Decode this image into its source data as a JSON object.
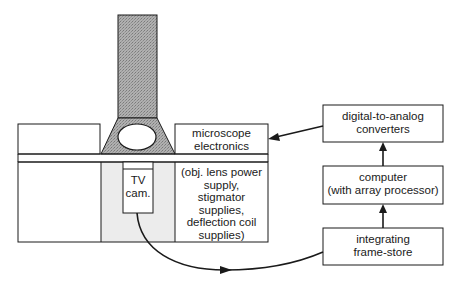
{
  "diagram": {
    "microscope": {
      "column_label": "",
      "tv_camera": {
        "lines": [
          "TV",
          "cam."
        ]
      },
      "electronics_box": {
        "lines": [
          "microscope",
          "electronics"
        ]
      },
      "supplies_box": {
        "lines": [
          "(obj. lens power",
          "supply,",
          "stigmator",
          "supplies,",
          "deflection coil",
          "supplies)"
        ]
      }
    },
    "blocks": {
      "dac": {
        "lines": [
          "digital-to-analog",
          "converters"
        ]
      },
      "computer": {
        "lines": [
          "computer",
          "(with array processor)"
        ]
      },
      "frame_store": {
        "lines": [
          "integrating",
          "frame-store"
        ]
      }
    },
    "connections": [
      {
        "from": "tv_camera",
        "to": "frame_store"
      },
      {
        "from": "frame_store",
        "to": "computer"
      },
      {
        "from": "computer",
        "to": "dac"
      },
      {
        "from": "dac",
        "to": "electronics_box"
      }
    ],
    "colors": {
      "stroke": "#1a1a1a",
      "column_fill": "#a9a9a9",
      "lower_column_fill": "#ececec"
    }
  }
}
